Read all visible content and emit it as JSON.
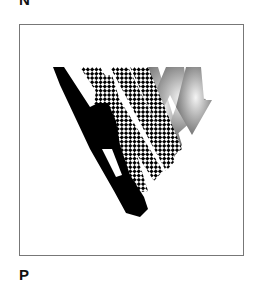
{
  "labels": {
    "top": "N",
    "bottom": "P"
  },
  "figure": {
    "colors": {
      "frame_border": "#777777",
      "solid_stroke": "#000000",
      "pattern_stroke": "#000000",
      "gradient_light": "#f0f0f0",
      "gradient_dark": "#7a7a7a"
    }
  }
}
